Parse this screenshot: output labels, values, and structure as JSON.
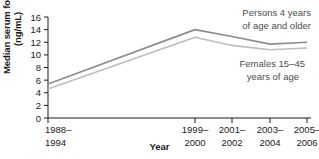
{
  "chart_data": {
    "type": "line",
    "title": "",
    "xlabel": "Year",
    "ylabel": "Median serum folate\n(ng/mL)",
    "categories": [
      "1988–1994",
      "1999–2000",
      "2001–2002",
      "2003–2004",
      "2005–2006"
    ],
    "category_lines": [
      [
        "1988–",
        "1994"
      ],
      [
        "1999–",
        "2000"
      ],
      [
        "2001–",
        "2002"
      ],
      [
        "2003–",
        "2004"
      ],
      [
        "2005–",
        "2006"
      ]
    ],
    "ylim": [
      0,
      16
    ],
    "yticks": [
      0,
      2,
      4,
      6,
      8,
      10,
      12,
      14,
      16
    ],
    "ytick_labels": [
      "0",
      "2",
      "4",
      "6",
      "8",
      "10",
      "12",
      "14",
      "16"
    ],
    "grid": false,
    "legend": "inline-annotations",
    "series": [
      {
        "name": "Persons 4 years of age and older",
        "color": "#8c8c8c",
        "values": [
          5.4,
          14.0,
          12.9,
          11.7,
          12.0
        ],
        "annotation": [
          "Persons 4 years",
          "of age and older"
        ]
      },
      {
        "name": "Females 15–45 years of age",
        "color": "#bdbdbd",
        "values": [
          4.6,
          12.8,
          11.5,
          10.8,
          11.1
        ],
        "annotation": [
          "Females 15–45",
          "years of age"
        ]
      }
    ],
    "axis_color": "#1a1a1a"
  },
  "annotations": {
    "upper": {
      "line1": "Persons 4 years",
      "line2": "of age and older"
    },
    "lower": {
      "line1": "Females 15–45",
      "line2": "years of age"
    }
  },
  "axis": {
    "ylabel_line1": "Median serum folate",
    "ylabel_line2": "(ng/mL)",
    "xlabel": "Year"
  }
}
